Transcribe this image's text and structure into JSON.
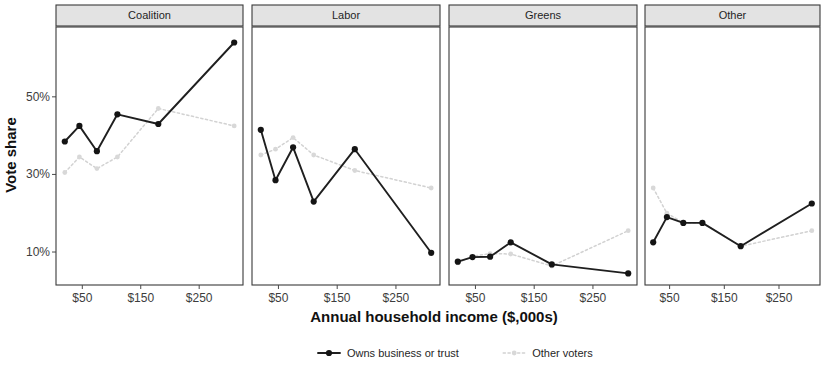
{
  "chart_data": {
    "type": "line",
    "title": "",
    "xlabel": "Annual household income ($,000s)",
    "ylabel": "Vote share",
    "facet_by": "party",
    "facets": [
      "Coalition",
      "Labor",
      "Greens",
      "Other"
    ],
    "x": [
      20,
      45,
      75,
      110,
      180,
      250,
      310
    ],
    "xticks": [
      50,
      150,
      250
    ],
    "xtick_labels": [
      "$50",
      "$150",
      "$250"
    ],
    "xlim": [
      5,
      325
    ],
    "yticks": [
      10,
      30,
      50
    ],
    "ytick_labels": [
      "10%",
      "30%",
      "50%"
    ],
    "ylim": [
      1.5,
      68
    ],
    "grid": false,
    "legend_position": "bottom",
    "series_names": [
      "Owns business or trust",
      "Other voters"
    ],
    "panels": [
      {
        "name": "Coalition",
        "series": [
          {
            "name": "Owns business or trust",
            "values": [
              38.5,
              42.5,
              36.0,
              45.5,
              43.0,
              null,
              64.0
            ]
          },
          {
            "name": "Other voters",
            "values": [
              30.5,
              34.5,
              31.5,
              34.5,
              47.0,
              null,
              42.5
            ]
          }
        ]
      },
      {
        "name": "Labor",
        "series": [
          {
            "name": "Owns business or trust",
            "values": [
              41.5,
              28.5,
              37.0,
              23.0,
              36.5,
              null,
              9.8
            ]
          },
          {
            "name": "Other voters",
            "values": [
              35.0,
              36.5,
              39.5,
              35.0,
              31.0,
              null,
              26.5
            ]
          }
        ]
      },
      {
        "name": "Greens",
        "series": [
          {
            "name": "Owns business or trust",
            "values": [
              7.5,
              8.7,
              8.8,
              12.5,
              6.8,
              null,
              4.5
            ]
          },
          {
            "name": "Other voters",
            "values": [
              7.2,
              8.9,
              9.6,
              9.5,
              6.4,
              null,
              15.5
            ]
          }
        ]
      },
      {
        "name": "Other",
        "series": [
          {
            "name": "Owns business or trust",
            "values": [
              12.5,
              19.0,
              17.5,
              17.5,
              11.5,
              null,
              22.5
            ]
          },
          {
            "name": "Other voters",
            "values": [
              26.5,
              20.0,
              17.5,
              17.5,
              11.5,
              null,
              15.5
            ]
          }
        ]
      }
    ],
    "colors": {
      "owns_business_or_trust": "#141414",
      "other_voters": "#d8d8d8",
      "panel_border": "#3a3a3a",
      "strip_fill": "#e3e3e3",
      "background": "#ffffff"
    }
  },
  "legend": {
    "items": [
      {
        "label": "Owns business or trust",
        "key": "owns",
        "marker": "solid-line-dot"
      },
      {
        "label": "Other voters",
        "key": "other",
        "marker": "dotted-line-dot"
      }
    ]
  }
}
